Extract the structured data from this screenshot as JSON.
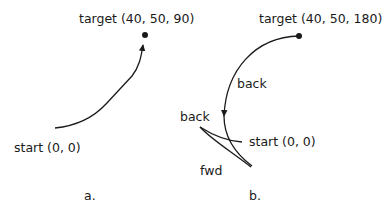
{
  "diagram_a": {
    "target_label": "target (40, 50, 90)",
    "start_label": "start (0, 0)",
    "caption": "a."
  },
  "diagram_b": {
    "target_label": "target (40, 50, 180)",
    "start_label": "start (0, 0)",
    "back_label_upper": "back",
    "back_label_lower": "back",
    "fwd_label": "fwd",
    "caption": "b."
  },
  "colors": {
    "stroke": "#1a1a1a",
    "background": "#ffffff"
  }
}
